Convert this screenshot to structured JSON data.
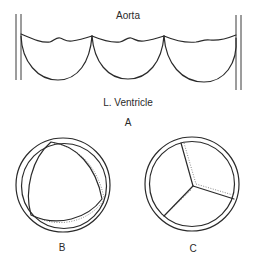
{
  "figure": {
    "panel_a": {
      "label": "A",
      "top_label": "Aorta",
      "bottom_label": "L. Ventricle",
      "description": "Longitudinal view of three aortic valve cusps between aortic walls"
    },
    "panel_b": {
      "label": "B",
      "description": "Valve ring viewed end-on with cusps open (triangular orifice)"
    },
    "panel_c": {
      "label": "C",
      "description": "Valve ring viewed end-on with three cusps closed (Y-shaped coaptation)"
    }
  }
}
